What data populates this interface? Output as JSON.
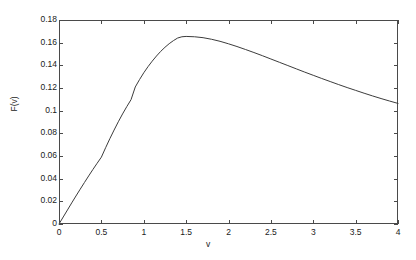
{
  "chart_data": {
    "type": "line",
    "title": "",
    "xlabel": "v",
    "ylabel": "F(v)",
    "xlim": [
      0,
      4
    ],
    "ylim": [
      0,
      0.18
    ],
    "xticks": [
      0,
      0.5,
      1,
      1.5,
      2,
      2.5,
      3,
      3.5,
      4
    ],
    "xtick_labels": [
      "0",
      "0.5",
      "1",
      "1.5",
      "2",
      "2.5",
      "3",
      "3.5",
      "4"
    ],
    "yticks": [
      0,
      0.02,
      0.04,
      0.06,
      0.08,
      0.1,
      0.12,
      0.14,
      0.16,
      0.18
    ],
    "ytick_labels": [
      "0",
      "0.02",
      "0.04",
      "0.06",
      "0.08",
      "0.1",
      "0.12",
      "0.14",
      "0.16",
      "0.18"
    ],
    "grid": false,
    "legend": false,
    "legend_position": "none",
    "line_color": "#3c3c3c",
    "line_width": 1,
    "background_color": "#ffffff",
    "frame_color": "#4a4a4a",
    "tick_direction": "in",
    "peak": {
      "x": 1.4,
      "y": 0.1655
    },
    "series": [
      {
        "name": "F(v)",
        "x": [
          0.0,
          0.05,
          0.1,
          0.15,
          0.2,
          0.25,
          0.3,
          0.35,
          0.4,
          0.45,
          0.5,
          0.55,
          0.6,
          0.65,
          0.7,
          0.75,
          0.8,
          0.85,
          0.9,
          0.95,
          1.0,
          1.05,
          1.1,
          1.15,
          1.2,
          1.25,
          1.3,
          1.35,
          1.4,
          1.45,
          1.5,
          1.6,
          1.7,
          1.8,
          1.9,
          2.0,
          2.1,
          2.2,
          2.3,
          2.4,
          2.5,
          2.6,
          2.7,
          2.8,
          2.9,
          3.0,
          3.1,
          3.2,
          3.3,
          3.4,
          3.5,
          3.6,
          3.7,
          3.8,
          3.9,
          4.0
        ],
        "y": [
          0.0,
          0.0062,
          0.0124,
          0.0186,
          0.0247,
          0.0307,
          0.0366,
          0.0424,
          0.0481,
          0.0536,
          0.059,
          0.0673,
          0.0753,
          0.0829,
          0.0902,
          0.0971,
          0.1036,
          0.1097,
          0.1209,
          0.1274,
          0.1334,
          0.1388,
          0.1437,
          0.1482,
          0.1523,
          0.1559,
          0.1591,
          0.1618,
          0.1641,
          0.1652,
          0.1655,
          0.1652,
          0.1644,
          0.163,
          0.1612,
          0.159,
          0.1566,
          0.154,
          0.1513,
          0.1485,
          0.1456,
          0.1427,
          0.1398,
          0.1369,
          0.134,
          0.1312,
          0.1284,
          0.1257,
          0.123,
          0.1204,
          0.1179,
          0.1154,
          0.113,
          0.1107,
          0.1085,
          0.1064
        ]
      }
    ]
  },
  "axes": {
    "x_label": "v",
    "y_label": "F(v)"
  }
}
